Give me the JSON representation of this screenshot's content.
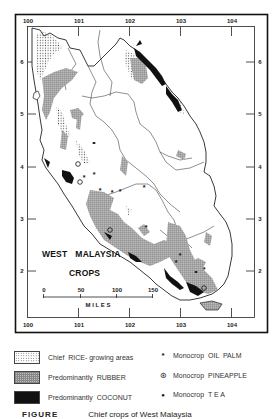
{
  "map": {
    "title_line1": "WEST MALAYSIA",
    "title_line1_a": "WEST",
    "title_line1_b": "MALAYSIA",
    "title_line2": "CROPS",
    "longitude_labels": [
      "100",
      "101",
      "102",
      "103",
      "104"
    ],
    "latitude_labels": [
      "6",
      "5",
      "4",
      "3",
      "2"
    ],
    "scale_bar": {
      "ticks": [
        "0",
        "50",
        "100",
        "150"
      ],
      "unit_label": "M I L E S"
    }
  },
  "legend": {
    "items": [
      {
        "label": "Chief  RICE- growing areas",
        "symbol": "dotted-pattern",
        "kind": "area"
      },
      {
        "label": "Predominantly  RUBBER",
        "symbol": "grid-pattern",
        "kind": "area"
      },
      {
        "label": "Predominantly  COCONUT",
        "symbol": "solid-black",
        "kind": "area"
      },
      {
        "label": "Monocrop  OIL  PALM",
        "symbol": "*",
        "kind": "point"
      },
      {
        "label": "Monocrop  PINEAPPLE",
        "symbol": "⊛",
        "kind": "point"
      },
      {
        "label": "Monocrop  T E A",
        "symbol": "●",
        "kind": "point"
      }
    ]
  },
  "caption": {
    "figure_label": "FIGURE",
    "text": "Chief crops of West Malaysia"
  },
  "colors": {
    "ink": "#111111",
    "rubber": "#9a9a9a",
    "paper": "#ffffff"
  }
}
